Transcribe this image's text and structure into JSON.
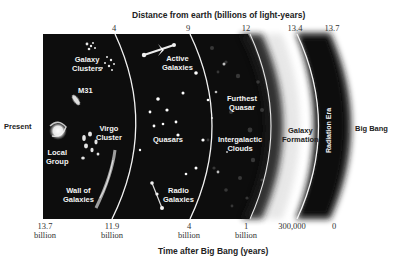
{
  "diagram": {
    "top_axis": {
      "title": "Distance from earth (billions of light-years)",
      "ticks": [
        "4",
        "9",
        "12",
        "13.4",
        "13.7"
      ]
    },
    "bottom_axis": {
      "title": "Time after Big Bang (years)",
      "ticks": [
        {
          "value": "13.7",
          "unit": "billion"
        },
        {
          "value": "11.9",
          "unit": "billion"
        },
        {
          "value": "4",
          "unit": "billion"
        },
        {
          "value": "1",
          "unit": "billion"
        },
        {
          "value": "300,000",
          "unit": ""
        },
        {
          "value": "0",
          "unit": ""
        }
      ]
    },
    "left_label": "Present",
    "right_label": "Big Bang",
    "regions": {
      "near": [
        "Galaxy Clusters",
        "M31",
        "Virgo Cluster",
        "Local Group",
        "Wall of Galaxies"
      ],
      "middle": [
        "Active Galaxies",
        "Quasars",
        "Radio Galaxies"
      ],
      "far": [
        "Furthest Quasar",
        "Intergalactic Clouds"
      ],
      "formation": "Galaxy Formation",
      "radiation": "Radiation Era"
    },
    "labels": {
      "galaxy_clusters": [
        "Galaxy",
        "Clusters"
      ],
      "m31": "M31",
      "virgo_cluster": [
        "Virgo",
        "Cluster"
      ],
      "local_group": [
        "Local",
        "Group"
      ],
      "wall_of_galaxies": [
        "Wall of",
        "Galaxies"
      ],
      "active_galaxies": [
        "Active",
        "Galaxies"
      ],
      "quasars": "Quasars",
      "radio_galaxies": [
        "Radio",
        "Galaxies"
      ],
      "furthest_quasar": [
        "Furthest",
        "Quasar"
      ],
      "intergalactic_clouds": [
        "Intergalactic",
        "Clouds"
      ],
      "galaxy_formation": [
        "Galaxy",
        "Formation"
      ],
      "radiation_era": "Radiation Era"
    },
    "colors": {
      "space": "#0d0d0d",
      "arc_line": "#f2f2f2",
      "background": "#ffffff"
    }
  }
}
